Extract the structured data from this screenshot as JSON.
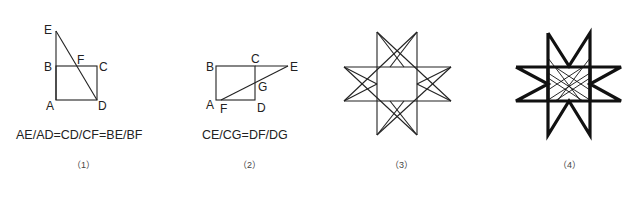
{
  "figures": [
    {
      "id": "1",
      "caption": "（1）",
      "formula": "AE/AD=CD/CF=BE/BF",
      "points": {
        "E": "E",
        "F": "F",
        "B": "B",
        "C": "C",
        "A": "A",
        "D": "D"
      }
    },
    {
      "id": "2",
      "caption": "（2）",
      "formula": "CE/CG=DF/DG",
      "points": {
        "B": "B",
        "C": "C",
        "E": "E",
        "G": "G",
        "A": "A",
        "F": "F",
        "D": "D"
      }
    },
    {
      "id": "3",
      "caption": "（3）",
      "description": "eight-pointed star, thin lines"
    },
    {
      "id": "4",
      "caption": "（4）",
      "description": "eight-pointed star, bold outline with thin inner lines"
    }
  ],
  "colors": {
    "stroke": "#222222",
    "background": "#ffffff"
  }
}
